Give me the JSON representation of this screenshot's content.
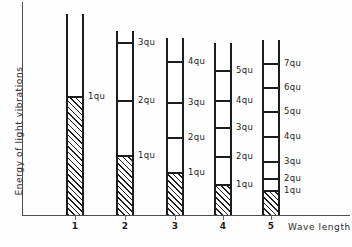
{
  "chart_data": {
    "type": "bar",
    "title": "",
    "xlabel": "Wave length",
    "ylabel": "Energy of light vibrations",
    "categories": [
      "1",
      "2",
      "3",
      "4",
      "5"
    ],
    "unit_label": "qu",
    "grid": false,
    "legend": "none",
    "note": "Hand-drawn diagram: five vertical tubes of light of increasing wave length; each tube is subdivided by tick marks into energy quanta, and the hatched region at the bottom of each tube marks one quantum of energy.",
    "series": [
      {
        "name": "filled quanta (hatched)",
        "values": [
          1,
          1,
          1,
          1,
          1
        ]
      },
      {
        "name": "marked energy levels per tube",
        "values": [
          1,
          3,
          4,
          5,
          7
        ]
      }
    ],
    "columns": [
      {
        "category": "1",
        "tube_left": 66,
        "tube_width": 18,
        "tube_top": 14,
        "fill_top": 96,
        "ticks": [
          {
            "label": "1qu",
            "y": 96
          }
        ]
      },
      {
        "category": "2",
        "tube_left": 116,
        "tube_width": 18,
        "tube_top": 31,
        "fill_top": 155,
        "ticks": [
          {
            "label": "3qu",
            "y": 42
          },
          {
            "label": "2qu",
            "y": 100
          },
          {
            "label": "1qu",
            "y": 155
          }
        ]
      },
      {
        "category": "3",
        "tube_left": 166,
        "tube_width": 18,
        "tube_top": 38,
        "fill_top": 172,
        "ticks": [
          {
            "label": "4qu",
            "y": 61
          },
          {
            "label": "3qu",
            "y": 102
          },
          {
            "label": "2qu",
            "y": 137
          },
          {
            "label": "1qu",
            "y": 172
          }
        ]
      },
      {
        "category": "4",
        "tube_left": 214,
        "tube_width": 18,
        "tube_top": 43,
        "fill_top": 184,
        "ticks": [
          {
            "label": "5qu",
            "y": 70
          },
          {
            "label": "4qu",
            "y": 100
          },
          {
            "label": "3qu",
            "y": 127
          },
          {
            "label": "2qu",
            "y": 156
          },
          {
            "label": "1qu",
            "y": 184
          }
        ]
      },
      {
        "category": "5",
        "tube_left": 262,
        "tube_width": 18,
        "tube_top": 40,
        "fill_top": 190,
        "ticks": [
          {
            "label": "7qu",
            "y": 63
          },
          {
            "label": "6qu",
            "y": 87
          },
          {
            "label": "5qu",
            "y": 111
          },
          {
            "label": "4qu",
            "y": 136
          },
          {
            "label": "3qu",
            "y": 161
          },
          {
            "label": "2qu",
            "y": 178
          },
          {
            "label": "1qu",
            "y": 190
          }
        ]
      }
    ],
    "axes": {
      "baseline_y": 215,
      "y_axis_x": 22,
      "colors": {
        "ink": "#1d1d1d",
        "axis": "#4c4c4c",
        "paper": "#fefefe"
      }
    }
  }
}
